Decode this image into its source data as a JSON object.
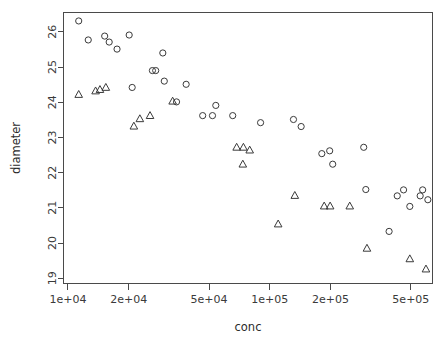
{
  "chart_data": {
    "type": "scatter",
    "title": "",
    "xlabel": "conc",
    "ylabel": "diameter",
    "xscale": "log",
    "yscale": "linear",
    "grid": false,
    "legend": "none",
    "xlim": [
      9500,
      640000
    ],
    "ylim": [
      18.85,
      26.55
    ],
    "xticks": [
      {
        "value": 10000,
        "label": "1e+04"
      },
      {
        "value": 20000,
        "label": "2e+04"
      },
      {
        "value": 50000,
        "label": "5e+04"
      },
      {
        "value": 100000,
        "label": "1e+05"
      },
      {
        "value": 200000,
        "label": "2e+05"
      },
      {
        "value": 500000,
        "label": "5e+05"
      }
    ],
    "yticks": [
      {
        "value": 19,
        "label": "19"
      },
      {
        "value": 20,
        "label": "20"
      },
      {
        "value": 21,
        "label": "21"
      },
      {
        "value": 22,
        "label": "22"
      },
      {
        "value": 23,
        "label": "23"
      },
      {
        "value": 24,
        "label": "24"
      },
      {
        "value": 25,
        "label": "25"
      },
      {
        "value": 26,
        "label": "26"
      }
    ],
    "series": [
      {
        "name": "circle-series",
        "marker": "circle",
        "color": "#3a3a3a",
        "points": [
          {
            "x": 11300,
            "y": 26.31
          },
          {
            "x": 12600,
            "y": 25.77
          },
          {
            "x": 15200,
            "y": 25.88
          },
          {
            "x": 16000,
            "y": 25.71
          },
          {
            "x": 17500,
            "y": 25.51
          },
          {
            "x": 20100,
            "y": 25.91
          },
          {
            "x": 20800,
            "y": 24.42
          },
          {
            "x": 26200,
            "y": 24.9
          },
          {
            "x": 27200,
            "y": 24.9
          },
          {
            "x": 29500,
            "y": 25.4
          },
          {
            "x": 30000,
            "y": 24.6
          },
          {
            "x": 34500,
            "y": 24.01
          },
          {
            "x": 38500,
            "y": 24.51
          },
          {
            "x": 46500,
            "y": 23.62
          },
          {
            "x": 52000,
            "y": 23.62
          },
          {
            "x": 54000,
            "y": 23.91
          },
          {
            "x": 65500,
            "y": 23.62
          },
          {
            "x": 90000,
            "y": 23.42
          },
          {
            "x": 131000,
            "y": 23.51
          },
          {
            "x": 143000,
            "y": 23.31
          },
          {
            "x": 181000,
            "y": 22.54
          },
          {
            "x": 198000,
            "y": 22.62
          },
          {
            "x": 205000,
            "y": 22.24
          },
          {
            "x": 292000,
            "y": 22.72
          },
          {
            "x": 299000,
            "y": 21.52
          },
          {
            "x": 390000,
            "y": 20.33
          },
          {
            "x": 428000,
            "y": 21.34
          },
          {
            "x": 460000,
            "y": 21.51
          },
          {
            "x": 494000,
            "y": 21.04
          },
          {
            "x": 556000,
            "y": 21.34
          },
          {
            "x": 572000,
            "y": 21.51
          },
          {
            "x": 607000,
            "y": 21.23
          }
        ]
      },
      {
        "name": "triangle-series",
        "marker": "triangle",
        "color": "#3a3a3a",
        "points": [
          {
            "x": 11300,
            "y": 24.22
          },
          {
            "x": 13700,
            "y": 24.32
          },
          {
            "x": 14400,
            "y": 24.36
          },
          {
            "x": 15400,
            "y": 24.42
          },
          {
            "x": 21200,
            "y": 23.32
          },
          {
            "x": 22700,
            "y": 23.53
          },
          {
            "x": 25500,
            "y": 23.62
          },
          {
            "x": 33000,
            "y": 24.03
          },
          {
            "x": 68500,
            "y": 22.72
          },
          {
            "x": 74000,
            "y": 22.72
          },
          {
            "x": 79500,
            "y": 22.64
          },
          {
            "x": 73500,
            "y": 22.24
          },
          {
            "x": 110000,
            "y": 20.54
          },
          {
            "x": 133000,
            "y": 21.35
          },
          {
            "x": 186000,
            "y": 21.05
          },
          {
            "x": 199000,
            "y": 21.05
          },
          {
            "x": 249000,
            "y": 21.05
          },
          {
            "x": 303000,
            "y": 19.85
          },
          {
            "x": 494000,
            "y": 19.55
          },
          {
            "x": 594000,
            "y": 19.26
          }
        ]
      }
    ]
  },
  "axes": {
    "x_title": "conc",
    "y_title": "diameter"
  },
  "style": {
    "frame_color": "#4a4a4a",
    "marker_color": "#3a3a3a",
    "background": "#ffffff"
  }
}
